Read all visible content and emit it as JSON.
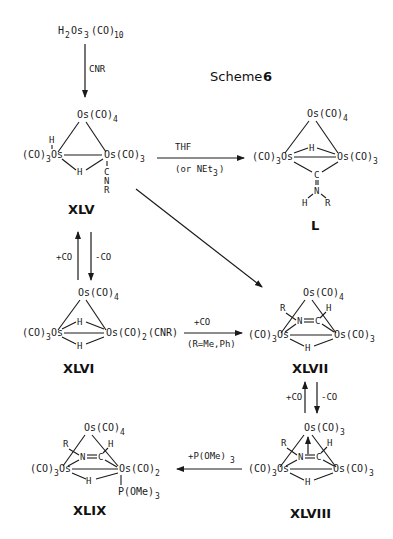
{
  "scheme": {
    "title": "Scheme",
    "number": "6"
  },
  "start_compound": {
    "formula_parts": [
      "H",
      "2",
      "Os",
      "3",
      "(CO)",
      "10"
    ]
  },
  "reagents": {
    "cnr": "CNR",
    "thf": "THF",
    "thf_alt": "(or NEt",
    "thf_alt_sub": "3",
    "thf_alt_close": ")",
    "plus_co": "+CO",
    "minus_co": "-CO",
    "plus_co_2": "+CO",
    "r_condition": "(R=Me,Ph)",
    "plus_co_3": "+CO",
    "minus_co_3": "-CO",
    "p_ome": "+P(OMe)",
    "p_ome_sub": "3"
  },
  "compounds": [
    {
      "id": "XLV",
      "label": "XLV"
    },
    {
      "id": "L",
      "label": "L"
    },
    {
      "id": "XLVI",
      "label": "XLVI"
    },
    {
      "id": "XLVII",
      "label": "XLVII"
    },
    {
      "id": "XLVIII",
      "label": "XLVIII"
    },
    {
      "id": "XLIX",
      "label": "XLIX"
    }
  ],
  "atoms": {
    "os": "Os",
    "co": "(CO)",
    "co_open": "(CO)",
    "h": "H",
    "c": "C",
    "n": "N",
    "r": "R",
    "cnr": "(CNR)",
    "pome": "P(OMe)",
    "n_eq_c": "N=C",
    "eq": "=",
    "n3": "3",
    "n4": "4",
    "n2": "2"
  }
}
